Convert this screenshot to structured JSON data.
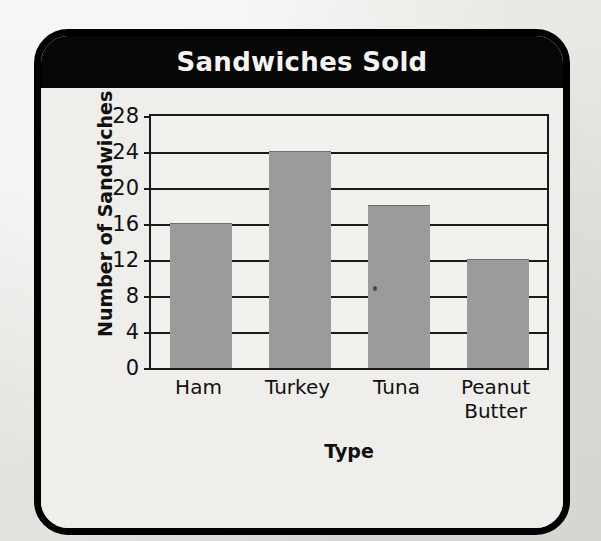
{
  "card": {
    "title": "Sandwiches Sold"
  },
  "chart_data": {
    "type": "bar",
    "title": "Sandwiches Sold",
    "xlabel": "Type",
    "ylabel": "Number of Sandwiches",
    "categories": [
      "Ham",
      "Turkey",
      "Tuna",
      "Peanut Butter"
    ],
    "category_lines": [
      [
        "Ham"
      ],
      [
        "Turkey"
      ],
      [
        "Tuna"
      ],
      [
        "Peanut",
        "Butter"
      ]
    ],
    "values": [
      16,
      24,
      18,
      12
    ],
    "ylim": [
      0,
      28
    ],
    "yticks": [
      0,
      4,
      8,
      12,
      16,
      20,
      24,
      28
    ],
    "ytick_labels": [
      "0",
      "4",
      "8",
      "12",
      "16",
      "20",
      "24",
      "28"
    ],
    "grid": true,
    "legend": "none",
    "bar_color": "#9b9b9b",
    "axis_color": "#1a1a1a",
    "plot_background": "#f2f1ed"
  },
  "colors": {
    "frame": "#000000",
    "title_bar": "#060606",
    "title_text": "#f4f4f2",
    "card_background": "#efeeea",
    "page_background": "#e9e8e4"
  }
}
